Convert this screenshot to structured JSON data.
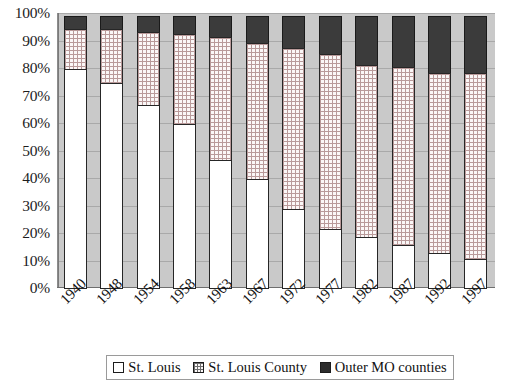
{
  "chart_data": {
    "type": "bar",
    "stacked": true,
    "title": "",
    "subtitle": "",
    "xlabel": "",
    "ylabel": "",
    "ylim": [
      0,
      100
    ],
    "ytick_labels": [
      "100%",
      "90%",
      "80%",
      "70%",
      "60%",
      "50%",
      "40%",
      "30%",
      "20%",
      "10%",
      "0%"
    ],
    "ytick_values": [
      100,
      90,
      80,
      70,
      60,
      50,
      40,
      30,
      20,
      10,
      0
    ],
    "grid": true,
    "grid_axis": "y",
    "legend_position": "bottom",
    "categories": [
      "1940",
      "1948",
      "1954",
      "1958",
      "1963",
      "1967",
      "1972",
      "1977",
      "1982",
      "1987",
      "1992",
      "1997"
    ],
    "series": [
      {
        "name": "St. Louis",
        "pattern": "solid-white",
        "color": "#ffffff",
        "values": [
          80,
          75,
          67,
          60,
          47,
          40,
          29,
          22,
          19,
          16,
          13,
          11
        ]
      },
      {
        "name": "St. Louis County",
        "pattern": "crosshatch",
        "color": "#fbf7f7",
        "values": [
          15,
          20,
          27,
          33,
          45,
          50,
          59,
          64,
          63,
          65,
          66,
          68
        ]
      },
      {
        "name": "Outer MO counties",
        "pattern": "solid-dark",
        "color": "#3b3b3b",
        "values": [
          5,
          5,
          6,
          7,
          8,
          10,
          12,
          14,
          18,
          19,
          21,
          21
        ]
      }
    ],
    "cumulative_tops": {
      "st_louis": [
        80,
        75,
        67,
        60,
        47,
        40,
        29,
        22,
        19,
        16,
        13,
        11
      ],
      "st_louis_county": [
        95,
        95,
        94,
        93,
        92,
        90,
        88,
        86,
        82,
        81,
        79,
        79
      ],
      "outer_mo_counties": [
        100,
        100,
        100,
        100,
        100,
        100,
        100,
        100,
        100,
        100,
        100,
        100
      ]
    },
    "annotations": [
      {
        "category": "1954",
        "type": "highlight-line",
        "value": 67,
        "color": "#2b4fa8"
      }
    ]
  },
  "legend": {
    "items": [
      {
        "label": "St. Louis",
        "swatch": "city"
      },
      {
        "label": "St. Louis County",
        "swatch": "county"
      },
      {
        "label": "Outer MO counties",
        "swatch": "outer"
      }
    ]
  },
  "colors": {
    "plot_background": "#c9c9c9",
    "gridline": "#a9a9a9",
    "bar_border": "#262626",
    "accent": "#2b4fa8"
  }
}
